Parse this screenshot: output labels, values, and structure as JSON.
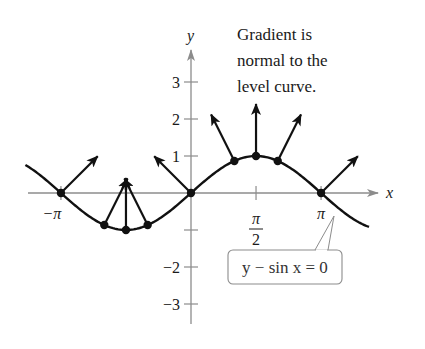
{
  "diagram": {
    "title_note": {
      "lines": [
        "Gradient is",
        "normal to the",
        "level curve."
      ]
    },
    "axes": {
      "x_label": "x",
      "y_label": "y",
      "x_ticks": [
        {
          "label": "−π",
          "value": -3.14159
        },
        {
          "label_num": "π",
          "label_den": "2",
          "value": 1.5708
        },
        {
          "label": "π",
          "value": 3.14159
        }
      ],
      "y_ticks": [
        {
          "label": "3",
          "value": 3
        },
        {
          "label": "2",
          "value": 2
        },
        {
          "label": "1",
          "value": 1
        },
        {
          "label": "",
          "value": -1
        },
        {
          "label": "−2",
          "value": -2
        },
        {
          "label": "−3",
          "value": -3
        }
      ]
    },
    "curve": {
      "equation": "y − sin x = 0",
      "function": "sin",
      "x_range": [
        -4.0,
        4.3
      ]
    },
    "gradient_points": [
      {
        "x": -3.14159,
        "label": "-pi"
      },
      {
        "x": -2.0944,
        "label": "-2pi/3"
      },
      {
        "x": -1.5708,
        "label": "-pi/2"
      },
      {
        "x": -1.0472,
        "label": "-pi/3"
      },
      {
        "x": 0,
        "label": "0"
      },
      {
        "x": 1.0472,
        "label": "pi/3"
      },
      {
        "x": 1.5708,
        "label": "pi/2"
      },
      {
        "x": 2.0944,
        "label": "2pi/3"
      },
      {
        "x": 3.14159,
        "label": "pi"
      }
    ],
    "callout_label": "y − sin x = 0",
    "colors": {
      "axis": "#8c8c8c",
      "curve": "#111111",
      "text": "#1a1a1a",
      "callout_border": "#8c8c8c"
    }
  }
}
